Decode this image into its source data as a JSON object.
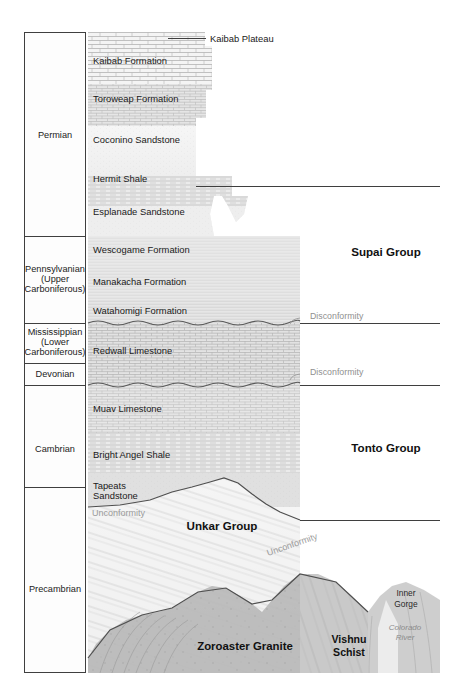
{
  "figure": {
    "colors": {
      "ink": "#1a1a1a",
      "rule": "#4d4d4d",
      "light_label": "#9a9a9a",
      "rock_light": "#f2f2f2",
      "rock_mid": "#d9d9d9",
      "rock_dark": "#a8a8a8"
    }
  },
  "time_column": {
    "periods": [
      {
        "label": "Permian",
        "lines": [
          "Permian"
        ]
      },
      {
        "label": "Pennsylvanian (Upper Carboniferous)",
        "lines": [
          "Pennsylvanian",
          "(Upper",
          "Carboniferous)"
        ]
      },
      {
        "label": "Mississippian (Lower Carboniferous)",
        "lines": [
          "Mississippian",
          "(Lower",
          "Carboniferous)"
        ]
      },
      {
        "label": "Devonian",
        "lines": [
          "Devonian"
        ]
      },
      {
        "label": "Cambrian",
        "lines": [
          "Cambrian"
        ]
      },
      {
        "label": "Precambrian",
        "lines": [
          "Precambrian"
        ]
      }
    ]
  },
  "formations": [
    {
      "name": "Kaibab Formation",
      "rock": "limestone"
    },
    {
      "name": "Toroweap Formation",
      "rock": "limestone-sandstone"
    },
    {
      "name": "Coconino Sandstone",
      "rock": "sandstone"
    },
    {
      "name": "Hermit Shale",
      "rock": "shale"
    },
    {
      "name": "Esplanade Sandstone",
      "rock": "sandstone"
    },
    {
      "name": "Wescogame Formation",
      "rock": "sandstone-siltstone"
    },
    {
      "name": "Manakacha Formation",
      "rock": "sandstone-siltstone"
    },
    {
      "name": "Watahomigi Formation",
      "rock": "siltstone-limestone"
    },
    {
      "name": "Redwall Limestone",
      "rock": "limestone"
    },
    {
      "name": "Muav Limestone",
      "rock": "limestone"
    },
    {
      "name": "Bright Angel Shale",
      "rock": "shale"
    },
    {
      "name": "Tapeats Sandstone",
      "lines": [
        "Tapeats",
        "Sandstone"
      ],
      "rock": "sandstone"
    }
  ],
  "groups": [
    {
      "name": "Supai Group"
    },
    {
      "name": "Tonto Group"
    },
    {
      "name": "Unkar Group"
    }
  ],
  "basement": [
    {
      "name": "Zoroaster Granite"
    },
    {
      "name": "Vishnu Schist",
      "lines": [
        "Vishnu",
        "Schist"
      ]
    }
  ],
  "contacts": [
    {
      "name": "Disconformity",
      "which": "upper"
    },
    {
      "name": "Disconformity",
      "which": "lower"
    },
    {
      "name": "Unconformity",
      "which": "great"
    },
    {
      "name": "Unconformity",
      "which": "tilted"
    }
  ],
  "annotations": [
    {
      "name": "Kaibab Plateau"
    },
    {
      "name": "Inner Gorge",
      "lines": [
        "Inner",
        "Gorge"
      ]
    },
    {
      "name": "Colorado River",
      "lines": [
        "Colorado",
        "River"
      ]
    }
  ]
}
